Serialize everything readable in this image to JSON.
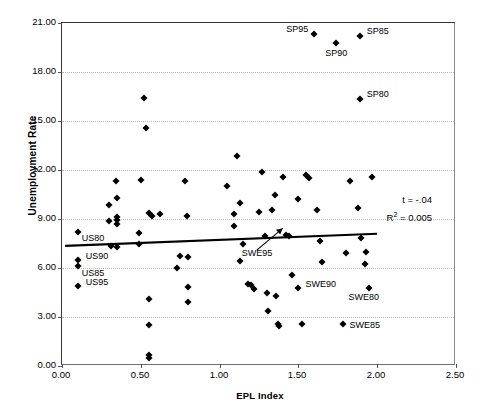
{
  "chart_data": {
    "type": "scatter",
    "title": "",
    "xlabel": "EPL Index",
    "ylabel": "Unemployment Rate",
    "xlim": [
      0.0,
      2.5
    ],
    "ylim": [
      0.0,
      21.0
    ],
    "xticks": [
      "0.00",
      "0.50",
      "1.00",
      "1.50",
      "2.00",
      "2.50"
    ],
    "yticks": [
      "0.00",
      "3.00",
      "6.00",
      "9.00",
      "12.00",
      "15.00",
      "18.00",
      "21.00"
    ],
    "grid": "horizontal-dotted",
    "legend": "none",
    "marker": "diamond",
    "marker_color": "#000000",
    "trendline": {
      "visible": true,
      "x_start": 0.02,
      "y_start": 7.28,
      "x_end": 2.01,
      "y_end": 8.02,
      "color": "#000000",
      "width": 2.2
    },
    "annotations": [
      {
        "text": "t = -.04"
      },
      {
        "text": "R2 = 0.005",
        "display": "R² = 0.005"
      }
    ],
    "labeled_points": [
      {
        "label": "SP95",
        "x": 1.6,
        "y": 20.35,
        "label_pos": "left"
      },
      {
        "label": "SP90",
        "x": 1.74,
        "y": 19.75,
        "label_pos": "below"
      },
      {
        "label": "SP85",
        "x": 1.89,
        "y": 20.2,
        "label_pos": "right"
      },
      {
        "label": "SP80",
        "x": 1.89,
        "y": 16.35,
        "label_pos": "right"
      },
      {
        "label": "US80",
        "x": 0.1,
        "y": 8.2,
        "label_pos": "right-below"
      },
      {
        "label": "US90",
        "x": 0.1,
        "y": 6.5,
        "label_pos": "right"
      },
      {
        "label": "US85",
        "x": 0.1,
        "y": 6.15,
        "label_pos": "right-below"
      },
      {
        "label": "US95",
        "x": 0.1,
        "y": 4.9,
        "label_pos": "right"
      },
      {
        "label": "SWE95",
        "x": 1.42,
        "y": 8.05,
        "label_pos": "arrow-from-below-left"
      },
      {
        "label": "SWE90",
        "x": 1.5,
        "y": 4.8,
        "label_pos": "right"
      },
      {
        "label": "SWE80",
        "x": 1.78,
        "y": 3.35,
        "label_pos": "label-only"
      },
      {
        "label": "SWE85",
        "x": 1.78,
        "y": 2.6,
        "label_pos": "right"
      }
    ],
    "points": [
      {
        "x": 0.1,
        "y": 8.2
      },
      {
        "x": 0.1,
        "y": 6.5
      },
      {
        "x": 0.1,
        "y": 6.15
      },
      {
        "x": 0.1,
        "y": 4.9
      },
      {
        "x": 0.3,
        "y": 9.85
      },
      {
        "x": 0.3,
        "y": 8.85
      },
      {
        "x": 0.31,
        "y": 7.35
      },
      {
        "x": 0.35,
        "y": 10.3
      },
      {
        "x": 0.35,
        "y": 9.1
      },
      {
        "x": 0.35,
        "y": 8.95
      },
      {
        "x": 0.35,
        "y": 8.7
      },
      {
        "x": 0.35,
        "y": 7.3
      },
      {
        "x": 0.34,
        "y": 11.3
      },
      {
        "x": 0.52,
        "y": 16.4
      },
      {
        "x": 0.53,
        "y": 14.55
      },
      {
        "x": 0.5,
        "y": 11.4
      },
      {
        "x": 0.49,
        "y": 8.15
      },
      {
        "x": 0.49,
        "y": 7.5
      },
      {
        "x": 0.55,
        "y": 9.35
      },
      {
        "x": 0.57,
        "y": 9.2
      },
      {
        "x": 0.55,
        "y": 4.1
      },
      {
        "x": 0.55,
        "y": 2.5
      },
      {
        "x": 0.55,
        "y": 0.65
      },
      {
        "x": 0.55,
        "y": 0.5
      },
      {
        "x": 0.73,
        "y": 6.0
      },
      {
        "x": 0.75,
        "y": 6.75
      },
      {
        "x": 0.78,
        "y": 11.35
      },
      {
        "x": 0.79,
        "y": 9.2
      },
      {
        "x": 0.8,
        "y": 6.7
      },
      {
        "x": 0.8,
        "y": 4.85
      },
      {
        "x": 0.8,
        "y": 3.9
      },
      {
        "x": 1.05,
        "y": 11.05
      },
      {
        "x": 1.09,
        "y": 9.3
      },
      {
        "x": 1.09,
        "y": 8.55
      },
      {
        "x": 1.11,
        "y": 12.85
      },
      {
        "x": 1.13,
        "y": 9.95
      },
      {
        "x": 1.15,
        "y": 7.45
      },
      {
        "x": 1.18,
        "y": 5.05
      },
      {
        "x": 1.2,
        "y": 4.95
      },
      {
        "x": 1.22,
        "y": 4.7
      },
      {
        "x": 1.25,
        "y": 9.4
      },
      {
        "x": 1.27,
        "y": 11.85
      },
      {
        "x": 1.29,
        "y": 7.95
      },
      {
        "x": 1.3,
        "y": 4.45
      },
      {
        "x": 1.31,
        "y": 3.35
      },
      {
        "x": 1.33,
        "y": 9.55
      },
      {
        "x": 1.35,
        "y": 10.45
      },
      {
        "x": 1.36,
        "y": 4.3
      },
      {
        "x": 1.37,
        "y": 2.55
      },
      {
        "x": 1.38,
        "y": 2.45
      },
      {
        "x": 1.4,
        "y": 11.55
      },
      {
        "x": 1.42,
        "y": 8.05
      },
      {
        "x": 1.44,
        "y": 7.95
      },
      {
        "x": 1.46,
        "y": 5.55
      },
      {
        "x": 1.5,
        "y": 10.2
      },
      {
        "x": 1.5,
        "y": 4.8
      },
      {
        "x": 1.52,
        "y": 2.55
      },
      {
        "x": 1.55,
        "y": 11.7
      },
      {
        "x": 1.57,
        "y": 11.5
      },
      {
        "x": 1.6,
        "y": 20.35
      },
      {
        "x": 1.62,
        "y": 9.55
      },
      {
        "x": 1.64,
        "y": 7.65
      },
      {
        "x": 1.65,
        "y": 6.35
      },
      {
        "x": 1.74,
        "y": 19.75
      },
      {
        "x": 1.78,
        "y": 2.6
      },
      {
        "x": 1.8,
        "y": 6.9
      },
      {
        "x": 1.83,
        "y": 11.3
      },
      {
        "x": 1.88,
        "y": 9.7
      },
      {
        "x": 1.89,
        "y": 20.2
      },
      {
        "x": 1.89,
        "y": 16.35
      },
      {
        "x": 1.9,
        "y": 7.85
      },
      {
        "x": 1.92,
        "y": 6.25
      },
      {
        "x": 1.93,
        "y": 6.95
      },
      {
        "x": 1.95,
        "y": 4.8
      },
      {
        "x": 1.97,
        "y": 11.6
      },
      {
        "x": 0.62,
        "y": 9.3
      },
      {
        "x": 1.13,
        "y": 6.45
      }
    ]
  },
  "caption": ""
}
